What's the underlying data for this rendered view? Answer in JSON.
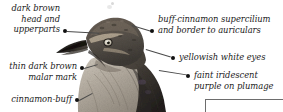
{
  "figure": {
    "background_color": "#ffffff",
    "label_color": "#1b1b1b",
    "leader_color": "#4a4a4a",
    "bullet_color": "#111111",
    "box_border_color": "#6d6d6d"
  },
  "annotations": [
    {
      "id": "dark-brown-head",
      "text": "dark brown\nhead and\nupperparts",
      "align": "right",
      "text_left": 4,
      "text_top": 3,
      "text_width": 56,
      "bullet_x": 63,
      "bullet_y": 29,
      "line_x": 67,
      "line_y": 31,
      "line_length": 32,
      "line_angle": 3
    },
    {
      "id": "buff-cinnamon-supercilium",
      "text": "buff-cinnamon supercilium\nand border to auriculars",
      "align": "left",
      "text_left": 158,
      "text_top": 14,
      "text_width": 125,
      "bullet_x": 150,
      "bullet_y": 29,
      "line_x": 132,
      "line_y": 25,
      "line_length": 20,
      "line_angle": 17
    },
    {
      "id": "yellowish-white-eyes",
      "text": "yellowish white eyes",
      "align": "left",
      "text_left": 179,
      "text_top": 52,
      "text_width": 104,
      "bullet_x": 171,
      "bullet_y": 56,
      "line_x": 146,
      "line_y": 49,
      "line_length": 26,
      "line_angle": 17
    },
    {
      "id": "faint-iridescent-purple",
      "text": "faint iridescent\npurple on plumage",
      "align": "left",
      "text_left": 194,
      "text_top": 70,
      "text_width": 89,
      "bullet_x": 186,
      "bullet_y": 74,
      "line_x": 159,
      "line_y": 70,
      "line_length": 28,
      "line_angle": 9
    },
    {
      "id": "thin-dark-brown-malar",
      "text": "thin dark brown\nmalar mark",
      "align": "right",
      "text_left": 1,
      "text_top": 61,
      "text_width": 76,
      "bullet_x": 80,
      "bullet_y": 66,
      "line_x": 84,
      "line_y": 68,
      "line_length": 14,
      "line_angle": -16
    },
    {
      "id": "cinnamon-buff",
      "text": "cinnamon-buff",
      "align": "right",
      "text_left": 1,
      "text_top": 94,
      "text_width": 71,
      "bullet_x": 75,
      "bullet_y": 98,
      "line_x": 79,
      "line_y": 100,
      "line_length": 15,
      "line_angle": -28
    }
  ],
  "inset_box": {
    "caption": ""
  }
}
